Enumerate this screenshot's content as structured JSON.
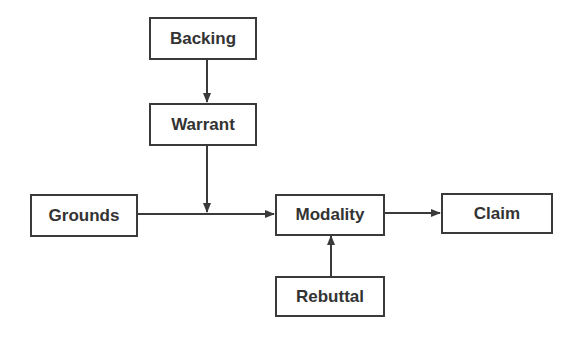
{
  "diagram": {
    "nodes": [
      {
        "id": "backing",
        "label": "Backing"
      },
      {
        "id": "warrant",
        "label": "Warrant"
      },
      {
        "id": "grounds",
        "label": "Grounds"
      },
      {
        "id": "modality",
        "label": "Modality"
      },
      {
        "id": "claim",
        "label": "Claim"
      },
      {
        "id": "rebuttal",
        "label": "Rebuttal"
      }
    ],
    "edges": [
      {
        "from": "backing",
        "to": "warrant"
      },
      {
        "from": "warrant",
        "to": "grounds-modality-link"
      },
      {
        "from": "grounds",
        "to": "modality"
      },
      {
        "from": "modality",
        "to": "claim"
      },
      {
        "from": "rebuttal",
        "to": "modality"
      }
    ],
    "colors": {
      "stroke": "#3a3a3a",
      "text": "#333333",
      "background": "#ffffff"
    }
  }
}
